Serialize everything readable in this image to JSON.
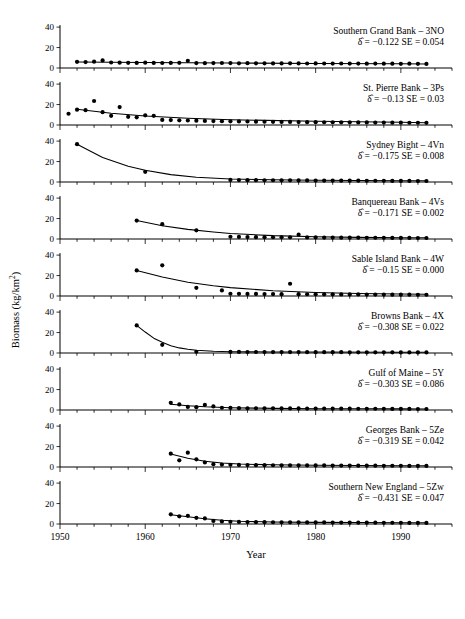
{
  "figure": {
    "xlabel": "Year",
    "ylabel_parts": {
      "pre": "Biomass (kg/km",
      "sup": "2",
      "post": ")"
    },
    "ylabel": "Biomass (kg/km2)"
  },
  "chart_data": {
    "type": "scatter",
    "title": "",
    "xlabel": "Year",
    "ylabel": "Biomass (kg/km²)",
    "xlim": [
      1950,
      1996
    ],
    "ylim": [
      0,
      45
    ],
    "yticks": [
      0,
      20,
      40
    ],
    "xticks": [
      1950,
      1960,
      1970,
      1980,
      1990
    ],
    "xtick_labels": [
      "1950",
      "1960",
      "1970",
      "1980",
      "1990"
    ],
    "minor_xtick_interval": 2,
    "grid": false,
    "legend": "none",
    "panel_layout": "9 stacked panels, shared x-axis",
    "panels": [
      {
        "label": "Southern Grand Bank – 3NO",
        "delta_hat": "-0.122",
        "se": "0.054",
        "stat_text": "δ = −0.122   SE = 0.054",
        "series_name": "biomass",
        "x": [
          1952,
          1953,
          1954,
          1955,
          1956,
          1957,
          1958,
          1959,
          1960,
          1961,
          1962,
          1963,
          1964,
          1965,
          1966,
          1967,
          1968,
          1969,
          1970,
          1971,
          1972,
          1973,
          1974,
          1975,
          1976,
          1977,
          1978,
          1979,
          1980,
          1981,
          1982,
          1983,
          1984,
          1985,
          1986,
          1987,
          1988,
          1989,
          1990,
          1991,
          1992,
          1993
        ],
        "y": [
          6.0,
          5.8,
          6.2,
          7.4,
          5.4,
          5.2,
          5.1,
          5.0,
          5.2,
          5.0,
          4.9,
          5.0,
          5.1,
          7.0,
          4.8,
          4.7,
          4.8,
          4.9,
          4.8,
          4.6,
          4.7,
          4.6,
          4.6,
          4.5,
          4.5,
          4.6,
          4.5,
          4.4,
          4.5,
          4.4,
          4.3,
          4.4,
          4.3,
          4.3,
          4.2,
          4.3,
          4.2,
          4.2,
          4.1,
          4.2,
          4.1,
          4.0
        ],
        "fit": [
          [
            1952,
            5.8
          ],
          [
            1960,
            5.4
          ],
          [
            1970,
            4.9
          ],
          [
            1980,
            4.5
          ],
          [
            1990,
            4.1
          ],
          [
            1993,
            4.0
          ]
        ]
      },
      {
        "label": "St. Pierre Bank – 3Ps",
        "delta_hat": "-0.13",
        "se": "0.03",
        "stat_text": "δ = −0.13   SE = 0.03",
        "series_name": "biomass",
        "x": [
          1951,
          1952,
          1953,
          1954,
          1955,
          1956,
          1957,
          1958,
          1959,
          1960,
          1961,
          1962,
          1963,
          1964,
          1965,
          1966,
          1967,
          1968,
          1969,
          1970,
          1971,
          1972,
          1973,
          1974,
          1975,
          1976,
          1977,
          1978,
          1979,
          1980,
          1981,
          1982,
          1983,
          1984,
          1985,
          1986,
          1987,
          1988,
          1989,
          1990,
          1991,
          1992,
          1993
        ],
        "y": [
          11.0,
          15.0,
          14.5,
          23.5,
          12.5,
          9.0,
          17.5,
          8.0,
          7.5,
          9.5,
          9.0,
          5.0,
          4.8,
          4.6,
          4.4,
          4.2,
          4.0,
          3.8,
          3.7,
          3.6,
          3.5,
          3.4,
          3.3,
          3.2,
          3.1,
          3.0,
          3.0,
          2.9,
          2.8,
          2.8,
          2.7,
          2.7,
          2.6,
          2.6,
          2.5,
          2.5,
          2.4,
          2.4,
          2.3,
          2.3,
          2.2,
          2.2,
          2.1
        ],
        "fit": [
          [
            1952,
            15.5
          ],
          [
            1956,
            11.5
          ],
          [
            1960,
            8.8
          ],
          [
            1965,
            6.6
          ],
          [
            1970,
            5.2
          ],
          [
            1980,
            3.6
          ],
          [
            1990,
            2.6
          ],
          [
            1993,
            2.3
          ]
        ]
      },
      {
        "label": "Sydney Bight – 4Vn",
        "delta_hat": "-0.175",
        "se": "0.008",
        "stat_text": "δ = −0.175   SE = 0.008",
        "series_name": "biomass",
        "x": [
          1952,
          1960,
          1970,
          1971,
          1972,
          1973,
          1974,
          1975,
          1976,
          1977,
          1978,
          1979,
          1980,
          1981,
          1982,
          1983,
          1984,
          1985,
          1986,
          1987,
          1988,
          1989,
          1990,
          1991,
          1992,
          1993
        ],
        "y": [
          37.0,
          10.0,
          2.0,
          1.9,
          1.8,
          1.8,
          1.7,
          1.7,
          1.6,
          1.6,
          1.5,
          1.5,
          1.4,
          1.4,
          1.4,
          1.3,
          1.3,
          1.3,
          1.2,
          1.2,
          1.2,
          1.1,
          1.1,
          1.1,
          1.0,
          1.0
        ],
        "fit": [
          [
            1952,
            37.0
          ],
          [
            1955,
            24.0
          ],
          [
            1958,
            15.5
          ],
          [
            1960,
            11.5
          ],
          [
            1963,
            7.2
          ],
          [
            1966,
            4.6
          ],
          [
            1970,
            2.9
          ],
          [
            1975,
            2.1
          ],
          [
            1980,
            1.7
          ],
          [
            1990,
            1.3
          ],
          [
            1993,
            1.2
          ]
        ]
      },
      {
        "label": "Banquereau Bank – 4Vs",
        "delta_hat": "-0.171",
        "se": "0.002",
        "stat_text": "δ = −0.171   SE = 0.002",
        "series_name": "biomass",
        "x": [
          1959,
          1962,
          1966,
          1970,
          1971,
          1972,
          1973,
          1974,
          1975,
          1976,
          1977,
          1978,
          1979,
          1980,
          1981,
          1982,
          1983,
          1984,
          1985,
          1986,
          1987,
          1988,
          1989,
          1990,
          1991,
          1992,
          1993
        ],
        "y": [
          18.0,
          14.5,
          8.5,
          2.2,
          2.0,
          1.9,
          1.8,
          1.8,
          1.7,
          1.7,
          1.6,
          4.2,
          1.5,
          1.5,
          1.4,
          1.4,
          1.3,
          1.3,
          1.3,
          1.2,
          1.2,
          1.2,
          1.1,
          1.1,
          1.1,
          1.0,
          1.0
        ],
        "fit": [
          [
            1959,
            18.0
          ],
          [
            1962,
            13.0
          ],
          [
            1965,
            9.4
          ],
          [
            1968,
            6.8
          ],
          [
            1970,
            5.4
          ],
          [
            1975,
            3.3
          ],
          [
            1980,
            2.2
          ],
          [
            1985,
            1.6
          ],
          [
            1990,
            1.3
          ],
          [
            1993,
            1.2
          ]
        ]
      },
      {
        "label": "Sable Island Bank – 4W",
        "delta_hat": "-0.15",
        "se": "0.000",
        "stat_text": "δ = −0.15   SE = 0.000",
        "series_name": "biomass",
        "x": [
          1959,
          1962,
          1966,
          1969,
          1970,
          1971,
          1972,
          1973,
          1974,
          1975,
          1976,
          1977,
          1978,
          1979,
          1980,
          1981,
          1982,
          1983,
          1984,
          1985,
          1986,
          1987,
          1988,
          1989,
          1990,
          1991,
          1992,
          1993
        ],
        "y": [
          25.0,
          30.0,
          8.0,
          5.5,
          2.2,
          2.1,
          2.0,
          2.0,
          1.9,
          1.9,
          1.8,
          12.0,
          1.8,
          1.7,
          1.7,
          1.6,
          1.6,
          1.5,
          1.5,
          1.5,
          1.4,
          1.4,
          1.4,
          1.3,
          1.3,
          1.3,
          1.2,
          1.2
        ],
        "fit": [
          [
            1959,
            25.0
          ],
          [
            1962,
            18.5
          ],
          [
            1965,
            13.5
          ],
          [
            1968,
            10.0
          ],
          [
            1970,
            8.2
          ],
          [
            1975,
            5.1
          ],
          [
            1980,
            3.4
          ],
          [
            1985,
            2.4
          ],
          [
            1990,
            1.9
          ],
          [
            1993,
            1.7
          ]
        ]
      },
      {
        "label": "Browns Bank – 4X",
        "delta_hat": "-0.308",
        "se": "0.022",
        "stat_text": "δ = −0.308   SE = 0.022",
        "series_name": "biomass",
        "x": [
          1959,
          1962,
          1966,
          1970,
          1971,
          1972,
          1973,
          1974,
          1975,
          1976,
          1977,
          1978,
          1979,
          1980,
          1981,
          1982,
          1983,
          1984,
          1985,
          1986,
          1987,
          1988,
          1989,
          1990,
          1991,
          1992,
          1993
        ],
        "y": [
          27.0,
          8.0,
          1.2,
          1.1,
          1.1,
          1.0,
          1.0,
          1.0,
          0.9,
          0.9,
          0.9,
          0.9,
          0.8,
          0.8,
          0.8,
          0.8,
          0.8,
          0.7,
          0.7,
          0.7,
          0.7,
          0.7,
          0.7,
          0.6,
          0.6,
          0.6,
          0.6
        ],
        "fit": [
          [
            1959,
            27.0
          ],
          [
            1960,
            20.5
          ],
          [
            1961,
            14.5
          ],
          [
            1962,
            10.5
          ],
          [
            1963,
            7.2
          ],
          [
            1964,
            5.0
          ],
          [
            1965,
            3.6
          ],
          [
            1966,
            2.6
          ],
          [
            1968,
            1.7
          ],
          [
            1970,
            1.3
          ],
          [
            1975,
            1.0
          ],
          [
            1980,
            0.9
          ],
          [
            1990,
            0.7
          ],
          [
            1993,
            0.7
          ]
        ]
      },
      {
        "label": "Gulf of Maine – 5Y",
        "delta_hat": "-0.303",
        "se": "0.086",
        "stat_text": "δ = −0.303   SE = 0.086",
        "series_name": "biomass",
        "x": [
          1963,
          1964,
          1965,
          1966,
          1967,
          1968,
          1969,
          1970,
          1971,
          1972,
          1973,
          1974,
          1975,
          1976,
          1977,
          1978,
          1979,
          1980,
          1981,
          1982,
          1983,
          1984,
          1985,
          1986,
          1987,
          1988,
          1989,
          1990,
          1991,
          1992,
          1993
        ],
        "y": [
          7.0,
          5.5,
          3.0,
          2.8,
          5.0,
          3.5,
          2.2,
          2.0,
          1.8,
          1.7,
          1.7,
          1.6,
          1.6,
          1.5,
          1.5,
          1.5,
          1.4,
          1.4,
          1.4,
          1.3,
          1.3,
          1.3,
          1.2,
          1.2,
          1.2,
          1.2,
          1.1,
          1.1,
          1.1,
          1.0,
          1.0
        ],
        "fit": [
          [
            1963,
            5.6
          ],
          [
            1965,
            4.1
          ],
          [
            1967,
            3.1
          ],
          [
            1970,
            2.2
          ],
          [
            1975,
            1.6
          ],
          [
            1980,
            1.3
          ],
          [
            1985,
            1.2
          ],
          [
            1990,
            1.1
          ],
          [
            1993,
            1.0
          ]
        ]
      },
      {
        "label": "Georges Bank – 5Ze",
        "delta_hat": "-0.319",
        "se": "0.042",
        "stat_text": "δ = −0.319   SE = 0.042",
        "series_name": "biomass",
        "x": [
          1963,
          1964,
          1965,
          1966,
          1967,
          1968,
          1969,
          1970,
          1971,
          1972,
          1973,
          1974,
          1975,
          1976,
          1977,
          1978,
          1979,
          1980,
          1981,
          1982,
          1983,
          1984,
          1985,
          1986,
          1987,
          1988,
          1989,
          1990,
          1991,
          1992,
          1993
        ],
        "y": [
          13.0,
          6.5,
          14.0,
          7.5,
          4.5,
          2.8,
          2.4,
          2.2,
          2.0,
          1.9,
          1.8,
          1.8,
          1.7,
          1.7,
          1.6,
          1.6,
          1.5,
          1.5,
          1.5,
          1.4,
          1.4,
          1.4,
          1.3,
          1.3,
          1.3,
          1.2,
          1.2,
          1.2,
          1.1,
          1.1,
          1.1
        ],
        "fit": [
          [
            1963,
            12.8
          ],
          [
            1965,
            8.5
          ],
          [
            1967,
            5.6
          ],
          [
            1969,
            3.9
          ],
          [
            1971,
            2.9
          ],
          [
            1975,
            2.1
          ],
          [
            1980,
            1.7
          ],
          [
            1985,
            1.4
          ],
          [
            1990,
            1.3
          ],
          [
            1993,
            1.2
          ]
        ]
      },
      {
        "label": "Southern New England – 5Zw",
        "delta_hat": "-0.431",
        "se": "0.047",
        "stat_text": "δ = −0.431   SE = 0.047",
        "series_name": "biomass",
        "x": [
          1963,
          1964,
          1965,
          1966,
          1967,
          1968,
          1969,
          1970,
          1971,
          1972,
          1973,
          1974,
          1975,
          1976,
          1977,
          1978,
          1979,
          1980,
          1981,
          1982,
          1983,
          1984,
          1985,
          1986,
          1987,
          1988,
          1989,
          1990,
          1991,
          1992,
          1993
        ],
        "y": [
          9.5,
          7.5,
          8.0,
          6.0,
          5.5,
          3.0,
          2.5,
          2.2,
          2.0,
          1.9,
          1.8,
          1.8,
          1.7,
          1.7,
          1.6,
          1.6,
          1.5,
          1.5,
          1.5,
          1.4,
          1.4,
          1.4,
          1.3,
          1.3,
          1.3,
          1.2,
          1.2,
          1.2,
          1.1,
          1.1,
          1.1
        ],
        "fit": [
          [
            1963,
            9.0
          ],
          [
            1965,
            7.0
          ],
          [
            1967,
            5.2
          ],
          [
            1969,
            3.6
          ],
          [
            1971,
            2.7
          ],
          [
            1975,
            2.0
          ],
          [
            1980,
            1.6
          ],
          [
            1985,
            1.4
          ],
          [
            1990,
            1.2
          ],
          [
            1993,
            1.2
          ]
        ]
      }
    ]
  }
}
